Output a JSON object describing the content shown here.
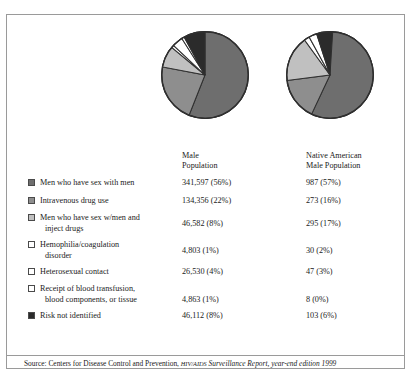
{
  "figure": {
    "source_prefix": "Source: Centers for Disease Control and Prevention, ",
    "source_smallcaps": "HIV/AIDS",
    "source_italic": " Surveillance Report, year-end edition 1999"
  },
  "columns": [
    {
      "id": "male-population",
      "header": "Male\nPopulation"
    },
    {
      "id": "native-american-male-population",
      "header": "Native American\nMale Population"
    }
  ],
  "chart_data": {
    "type": "pie",
    "title": "",
    "legend_position": "bottom-left",
    "categories": [
      "Men who have sex with men",
      "Intravenous drug use",
      "Men who have sex w/men and inject drugs",
      "Hemophilia/coagulation disorder",
      "Heterosexual contact",
      "Receipt of blood transfusion, blood components, or tissue",
      "Risk not identified"
    ],
    "colors": [
      "#6e6e6e",
      "#8e8e8e",
      "#c0c0c0",
      "#ffffff",
      "#ffffff",
      "#ffffff",
      "#2b2b2b"
    ],
    "series": [
      {
        "name": "Male Population",
        "values": [
          341597,
          134356,
          46582,
          4803,
          26530,
          4863,
          46112
        ],
        "percents": [
          56,
          22,
          8,
          1,
          4,
          1,
          8
        ],
        "labels": [
          "341,597 (56%)",
          "134,356 (22%)",
          "46,582 (8%)",
          "4,803 (1%)",
          "26,530 (4%)",
          "4,863 (1%)",
          "46,112 (8%)"
        ]
      },
      {
        "name": "Native American Male Population",
        "values": [
          987,
          273,
          295,
          30,
          47,
          8,
          103
        ],
        "percents": [
          57,
          16,
          17,
          2,
          3,
          0,
          6
        ],
        "labels": [
          "987 (57%)",
          "273 (16%)",
          "295 (17%)",
          "30 (2%)",
          "47 (3%)",
          "8 (0%)",
          "103 (6%)"
        ]
      }
    ]
  },
  "legend_rows": [
    {
      "label_line1": "Men who have sex with men",
      "label_line2": "",
      "swatch": "#6e6e6e",
      "v1": "341,597 (56%)",
      "v2": "987 (57%)"
    },
    {
      "label_line1": "Intravenous drug use",
      "label_line2": "",
      "swatch": "#8e8e8e",
      "v1": "134,356 (22%)",
      "v2": "273 (16%)"
    },
    {
      "label_line1": "Men who have sex w/men and",
      "label_line2": "inject drugs",
      "swatch": "#c0c0c0",
      "v1": "46,582 (8%)",
      "v2": "295 (17%)"
    },
    {
      "label_line1": "Hemophilia/coagulation",
      "label_line2": "disorder",
      "swatch": "#ffffff",
      "v1": "4,803 (1%)",
      "v2": "30 (2%)"
    },
    {
      "label_line1": "Heterosexual contact",
      "label_line2": "",
      "swatch": "#ffffff",
      "v1": "26,530 (4%)",
      "v2": "47 (3%)"
    },
    {
      "label_line1": "Receipt of blood transfusion,",
      "label_line2": "blood components, or tissue",
      "swatch": "#ffffff",
      "v1": "4,863 (1%)",
      "v2": "8 (0%)"
    },
    {
      "label_line1": "Risk not identified",
      "label_line2": "",
      "swatch": "#2b2b2b",
      "v1": "46,112 (8%)",
      "v2": "103 (6%)"
    }
  ]
}
